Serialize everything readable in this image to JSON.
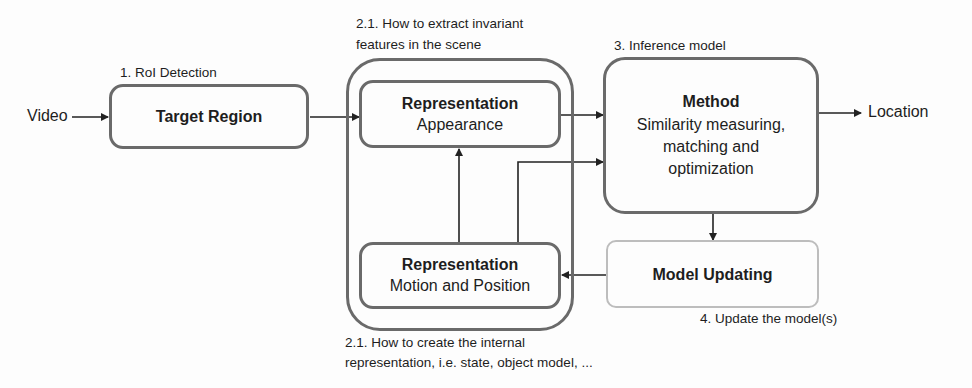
{
  "diagram": {
    "inputs": {
      "video": "Video"
    },
    "outputs": {
      "location": "Location"
    },
    "annotations": {
      "roi_detection": "1. RoI Detection",
      "extract_features_line1": "2.1. How to extract invariant",
      "extract_features_line2": "features in the scene",
      "inference_model": "3. Inference model",
      "internal_repr_line1": "2.1. How to create the internal",
      "internal_repr_line2": "representation, i.e. state, object model, ...",
      "update_model": "4. Update the model(s)"
    },
    "nodes": {
      "target_region": {
        "title": "Target Region"
      },
      "repr_appearance": {
        "title": "Representation",
        "subtitle": "Appearance"
      },
      "repr_motion": {
        "title": "Representation",
        "subtitle": "Motion and Position"
      },
      "method": {
        "title": "Method",
        "subtitle_line1": "Similarity measuring,",
        "subtitle_line2": "matching and",
        "subtitle_line3": "optimization"
      },
      "model_updating": {
        "title": "Model Updating"
      }
    },
    "edges": [
      {
        "from": "Video",
        "to": "Target Region"
      },
      {
        "from": "Target Region",
        "to": "Representation (Appearance)"
      },
      {
        "from": "Representation (Appearance)",
        "to": "Method"
      },
      {
        "from": "Representation (Motion and Position)",
        "to": "Representation (Appearance)"
      },
      {
        "from": "Representation (Motion and Position)",
        "to": "Method"
      },
      {
        "from": "Method",
        "to": "Location"
      },
      {
        "from": "Method",
        "to": "Model Updating"
      },
      {
        "from": "Model Updating",
        "to": "Representation (Motion and Position)"
      }
    ],
    "colors": {
      "box_border": "#6a6a6a",
      "faded_border": "#bdbdbd",
      "arrow": "#222222",
      "text": "#1e1e1e"
    }
  }
}
